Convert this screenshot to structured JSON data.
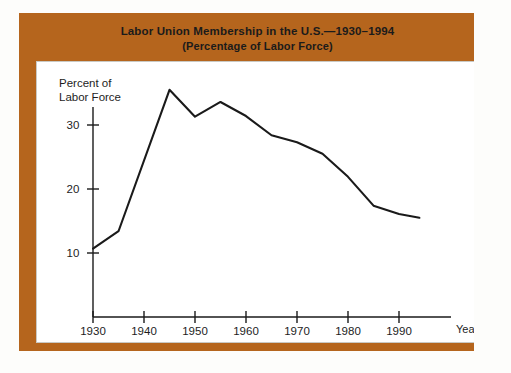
{
  "figure": {
    "frame_color": "#b5651d",
    "background_color": "#ffffff",
    "page_color": "#fdfdfb"
  },
  "banner": {
    "title": "Labor Union Membership in the U.S.—1930–1994",
    "subtitle": "(Percentage of Labor Force)"
  },
  "chart_data": {
    "type": "line",
    "title": "Labor Union Membership in the U.S.—1930–1994",
    "subtitle": "(Percentage of Labor Force)",
    "xlabel": "Year",
    "ylabel": "Percent of Labor Force",
    "ylabel_lines": [
      "Percent of",
      "Labor Force"
    ],
    "xlim": [
      1930,
      1994
    ],
    "ylim": [
      8,
      38
    ],
    "grid": false,
    "legend": null,
    "line_color": "#1a1a1a",
    "xticks": [
      1930,
      1940,
      1950,
      1960,
      1970,
      1980,
      1990
    ],
    "xtick_labels": [
      "1930",
      "1940",
      "1950",
      "1960",
      "1970",
      "1980",
      "1990"
    ],
    "yticks": [
      10,
      20,
      30
    ],
    "ytick_labels": [
      "10",
      "20",
      "30"
    ],
    "x": [
      1930,
      1935,
      1945,
      1950,
      1955,
      1960,
      1965,
      1970,
      1975,
      1980,
      1985,
      1990,
      1994
    ],
    "y": [
      10.7,
      13.4,
      35.5,
      31.3,
      33.6,
      31.4,
      28.4,
      27.3,
      25.5,
      21.9,
      17.4,
      16.1,
      15.5
    ],
    "series": [
      {
        "name": "Percent of Labor Force",
        "values": [
          10.7,
          13.4,
          35.5,
          31.3,
          33.6,
          31.4,
          28.4,
          27.3,
          25.5,
          21.9,
          17.4,
          16.1,
          15.5
        ]
      }
    ],
    "annotations": []
  }
}
